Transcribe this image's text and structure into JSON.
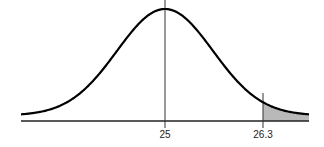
{
  "chart_data": {
    "type": "area",
    "title": "",
    "xlabel": "",
    "ylabel": "",
    "mean": 25,
    "shade_from": 26.3,
    "shade_to": "right tail",
    "tick_labels": [
      "25",
      "26.3"
    ],
    "grid": false,
    "legend": "none",
    "colors": {
      "curve": "#000000",
      "shade": "#c8c8c8",
      "axis": "#222222"
    }
  }
}
